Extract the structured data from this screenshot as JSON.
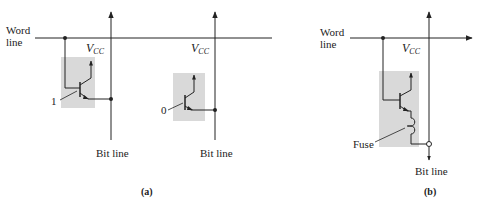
{
  "figure": {
    "panel_a": {
      "caption": "(a)",
      "word_line_label_1": "Word",
      "word_line_label_2": "line",
      "cells": [
        {
          "stored_bit": "1",
          "vcc_label": "V",
          "vcc_sub": "CC",
          "bit_line_label": "Bit line"
        },
        {
          "stored_bit": "0",
          "vcc_label": "V",
          "vcc_sub": "CC",
          "bit_line_label": "Bit line"
        }
      ]
    },
    "panel_b": {
      "caption": "(b)",
      "word_line_label_1": "Word",
      "word_line_label_2": "line",
      "vcc_label": "V",
      "vcc_sub": "CC",
      "fuse_label": "Fuse",
      "bit_line_label": "Bit line"
    },
    "colors": {
      "line": "#222222",
      "cell_fill": "#d9d9d9",
      "background": "#ffffff"
    }
  }
}
